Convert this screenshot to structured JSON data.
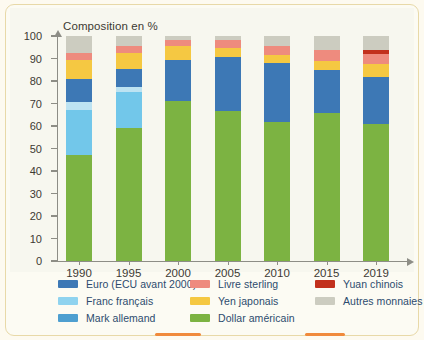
{
  "chart_data": {
    "type": "bar",
    "subtype": "stacked-column-100",
    "title": "Composition en %",
    "xlabel": "",
    "ylabel": "",
    "ylim": [
      0,
      100
    ],
    "ytick_step": 10,
    "grid": false,
    "legend_position": "bottom",
    "categories": [
      "1990",
      "1995",
      "2000",
      "2005",
      "2010",
      "2015",
      "2019"
    ],
    "yticks": [
      "0",
      "10",
      "20",
      "30",
      "40",
      "50",
      "60",
      "70",
      "80",
      "90",
      "100"
    ],
    "series": [
      {
        "name": "Dollar américain",
        "color": "#7cb342",
        "values": [
          47,
          59,
          71,
          66.5,
          62,
          66,
          61
        ]
      },
      {
        "name": "Franc français",
        "color": "#72c7ea",
        "values": [
          20,
          16,
          0,
          0,
          0,
          0,
          0
        ]
      },
      {
        "name": "Mark allemand",
        "color": "#bde3f2",
        "values": [
          3.5,
          2.5,
          0,
          0,
          0,
          0,
          0
        ]
      },
      {
        "name": "Euro (ECU avant 2000)",
        "color": "#3d78b5",
        "values": [
          10.5,
          8,
          18.5,
          24,
          26,
          19,
          21
        ]
      },
      {
        "name": "Yen japonais",
        "color": "#f5c842",
        "values": [
          8.5,
          7,
          6,
          4,
          3.7,
          4,
          5.5
        ]
      },
      {
        "name": "Livre sterling",
        "color": "#ee8b7e",
        "values": [
          3,
          3,
          2.8,
          3.7,
          3.9,
          4.9,
          4.5
        ]
      },
      {
        "name": "Yuan chinois",
        "color": "#c2301c",
        "values": [
          0,
          0,
          0,
          0,
          0,
          0,
          2
        ]
      },
      {
        "name": "Autres monnaies",
        "color": "#ccccc0",
        "values": [
          7.5,
          4.5,
          1.7,
          1.8,
          4.4,
          6.1,
          6
        ]
      }
    ]
  },
  "legend": {
    "entries": [
      {
        "label": "Euro (ECU avant 2000)",
        "color": "#3d78b5",
        "col": 0,
        "row": 0
      },
      {
        "label": "Franc français",
        "color": "#8fd3ef",
        "col": 0,
        "row": 1
      },
      {
        "label": "Mark allemand",
        "color": "#4e9fd0",
        "col": 0,
        "row": 2
      },
      {
        "label": "Livre sterling",
        "color": "#ee8b7e",
        "col": 1,
        "row": 0
      },
      {
        "label": "Yen japonais",
        "color": "#f5c842",
        "col": 1,
        "row": 1
      },
      {
        "label": "Dollar américain",
        "color": "#7cb342",
        "col": 1,
        "row": 2
      },
      {
        "label": "Yuan chinois",
        "color": "#c2301c",
        "col": 2,
        "row": 0
      },
      {
        "label": "Autres monnaies",
        "color": "#ccccc0",
        "col": 2,
        "row": 1
      }
    ]
  },
  "colors": {
    "page_background": "#fdfaf0",
    "frame_border": "#e8d9a8",
    "plot_background": "#f7f7ef",
    "axis": "#8d8d86",
    "text": "#3d3a33",
    "legend_text": "#2c4b6e",
    "accent": "#f08a3c"
  }
}
